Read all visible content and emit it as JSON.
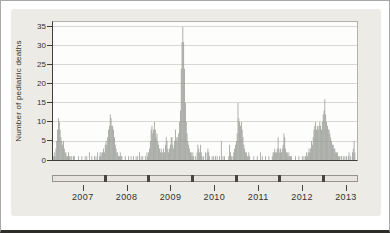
{
  "colors": {
    "bar": "#939691",
    "panel_bg": "#ecebe6",
    "plot_bg": "#fdfdfc",
    "grid": "#d9d7d1",
    "axis_dark": "#403f39",
    "frame_light": "#b3b2ac",
    "band_bg": "#e6e4dd",
    "band_block": "#45443e",
    "text": "#33322d"
  },
  "y_axis": {
    "title": "Number of pediatric deaths"
  },
  "chart_data": {
    "type": "bar",
    "title": "",
    "ylabel": "Number of pediatric deaths",
    "xlabel": "",
    "x_unit": "week",
    "ylim": [
      0,
      36.3
    ],
    "yticks": [
      0,
      5,
      10,
      15,
      20,
      25,
      30,
      35
    ],
    "x_tick_labels": [
      "2007",
      "2008",
      "2009",
      "2010",
      "2011",
      "2012",
      "2013"
    ],
    "first_label_year": 2007,
    "jan2007_week_index": 10.5,
    "weeks_per_year": 52.18,
    "grid": true,
    "legend": false,
    "values": [
      1,
      2,
      1,
      3,
      5,
      8,
      11,
      10,
      8,
      6,
      5,
      4,
      5,
      3,
      2,
      2,
      1,
      1,
      2,
      1,
      1,
      0,
      1,
      0,
      1,
      1,
      0,
      0,
      0,
      0,
      1,
      0,
      0,
      0,
      1,
      0,
      0,
      0,
      1,
      0,
      1,
      0,
      0,
      2,
      0,
      0,
      1,
      0,
      0,
      1,
      0,
      1,
      0,
      2,
      0,
      1,
      2,
      1,
      2,
      2,
      3,
      2,
      4,
      5,
      4,
      6,
      8,
      9,
      12,
      11,
      9,
      9,
      8,
      6,
      4,
      3,
      2,
      2,
      1,
      1,
      2,
      1,
      1,
      0,
      0,
      0,
      1,
      0,
      0,
      0,
      1,
      0,
      0,
      1,
      0,
      0,
      1,
      0,
      0,
      1,
      0,
      1,
      0,
      2,
      0,
      1,
      0,
      1,
      0,
      0,
      1,
      0,
      2,
      1,
      2,
      3,
      5,
      8,
      9,
      7,
      8,
      10,
      8,
      6,
      7,
      5,
      4,
      3,
      2,
      3,
      2,
      2,
      3,
      2,
      4,
      6,
      5,
      3,
      2,
      3,
      4,
      6,
      6,
      4,
      3,
      5,
      8,
      6,
      5,
      6,
      7,
      10,
      13,
      24,
      31,
      35,
      31,
      24,
      15,
      10,
      7,
      5,
      4,
      3,
      2,
      2,
      1,
      2,
      1,
      0,
      1,
      0,
      2,
      4,
      3,
      2,
      4,
      2,
      1,
      0,
      1,
      0,
      2,
      0,
      2,
      3,
      2,
      1,
      0,
      0,
      1,
      0,
      1,
      0,
      1,
      0,
      1,
      0,
      0,
      1,
      0,
      5,
      0,
      1,
      0,
      1,
      0,
      0,
      0,
      0,
      1,
      4,
      2,
      1,
      0,
      1,
      2,
      3,
      4,
      5,
      7,
      15,
      11,
      10,
      9,
      10,
      8,
      6,
      4,
      3,
      2,
      2,
      1,
      1,
      2,
      1,
      0,
      0,
      0,
      0,
      1,
      0,
      0,
      0,
      1,
      0,
      0,
      0,
      2,
      0,
      1,
      0,
      0,
      0,
      1,
      0,
      0,
      0,
      1,
      0,
      0,
      0,
      1,
      2,
      2,
      3,
      2,
      2,
      3,
      6,
      3,
      2,
      3,
      2,
      3,
      4,
      7,
      6,
      3,
      2,
      2,
      1,
      2,
      1,
      1,
      1,
      0,
      0,
      0,
      0,
      1,
      0,
      0,
      0,
      1,
      0,
      0,
      0,
      1,
      0,
      1,
      0,
      1,
      2,
      1,
      2,
      3,
      2,
      3,
      5,
      4,
      6,
      8,
      9,
      10,
      8,
      9,
      8,
      9,
      10,
      9,
      8,
      10,
      12,
      13,
      16,
      12,
      10,
      9,
      8,
      8,
      7,
      6,
      5,
      4,
      4,
      3,
      3,
      2,
      2,
      2,
      1,
      1,
      1,
      0,
      1,
      0,
      1,
      0,
      1,
      0,
      1,
      0,
      1,
      2,
      0,
      1,
      0,
      2,
      3,
      5,
      2,
      0,
      0
    ]
  }
}
